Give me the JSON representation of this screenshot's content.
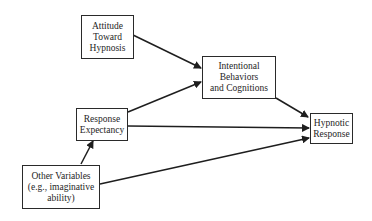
{
  "diagram": {
    "nodes": [
      {
        "id": "attitude",
        "lines": [
          "Attitude",
          "Toward",
          "Hypnosis"
        ]
      },
      {
        "id": "intentional",
        "lines": [
          "Intentional",
          "Behaviors",
          "and Cognitions"
        ]
      },
      {
        "id": "expectancy",
        "lines": [
          "Response",
          "Expectancy"
        ]
      },
      {
        "id": "hypnotic",
        "lines": [
          "Hypnotic",
          "Response"
        ]
      },
      {
        "id": "other",
        "lines": [
          "Other Variables",
          "(e.g., imaginative",
          "ability)"
        ]
      }
    ],
    "edges": [
      {
        "from": "attitude",
        "to": "intentional"
      },
      {
        "from": "expectancy",
        "to": "intentional"
      },
      {
        "from": "expectancy",
        "to": "hypnotic"
      },
      {
        "from": "intentional",
        "to": "hypnotic"
      },
      {
        "from": "other",
        "to": "expectancy"
      },
      {
        "from": "other",
        "to": "hypnotic"
      }
    ]
  }
}
